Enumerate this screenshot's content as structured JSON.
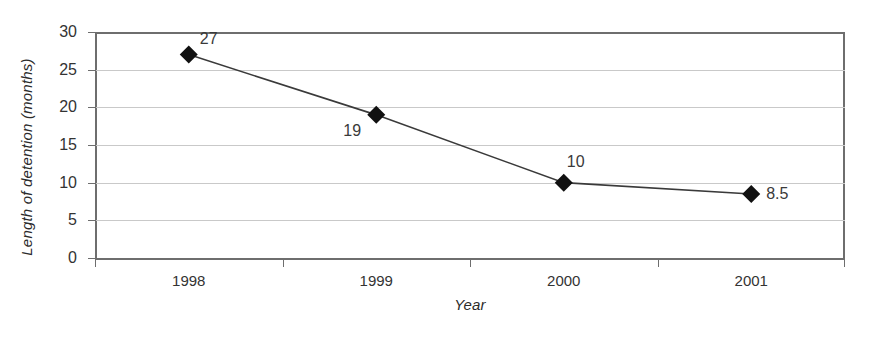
{
  "chart_data": {
    "type": "line",
    "title": "",
    "xlabel": "Year",
    "ylabel": "Length of detention (months)",
    "categories": [
      "1998",
      "1999",
      "2000",
      "2001"
    ],
    "values": [
      27,
      19,
      10,
      8.5
    ],
    "point_labels": [
      "27",
      "19",
      "10",
      "8.5"
    ],
    "series": [
      {
        "name": "Length of detention",
        "values": [
          27,
          19,
          10,
          8.5
        ],
        "marker": "diamond",
        "marker_color": "#111111",
        "line_color": "#3a3a3a"
      }
    ],
    "ylim": [
      0,
      30
    ],
    "yticks": [
      0,
      5,
      10,
      15,
      20,
      25,
      30
    ],
    "ytick_labels": [
      "0",
      "5",
      "10",
      "15",
      "20",
      "25",
      "30"
    ],
    "grid": true,
    "grid_axis": "y",
    "grid_color": "#c9c9c9",
    "legend": "none",
    "background": "#ffffff",
    "axis_color": "#6e6e6e"
  },
  "axes": {
    "y_title": "Length of detention (months)",
    "x_title": "Year"
  }
}
